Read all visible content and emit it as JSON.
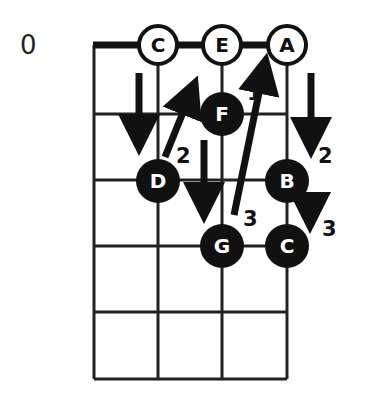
{
  "diagram": {
    "fret_label": "0",
    "strings": 4,
    "frets": 5,
    "open_notes": [
      {
        "label": "C",
        "string": 1
      },
      {
        "label": "E",
        "string": 2
      },
      {
        "label": "A",
        "string": 3
      }
    ],
    "fretted_notes": [
      {
        "label": "D",
        "string": 0,
        "fret": 2
      },
      {
        "label": "F",
        "string": 1,
        "fret": 1
      },
      {
        "label": "G",
        "string": 1,
        "fret": 3
      },
      {
        "label": "B",
        "string": 3,
        "fret": 2
      },
      {
        "label": "C",
        "string": 3,
        "fret": 3
      }
    ],
    "finger_numbers": [
      {
        "label": "1",
        "near": "F-to-A"
      },
      {
        "label": "2",
        "near": "D"
      },
      {
        "label": "2",
        "near": "A-to-B"
      },
      {
        "label": "3",
        "near": "G"
      },
      {
        "label": "3",
        "near": "B-to-C"
      }
    ],
    "colors": {
      "ink": "#111111",
      "background": "#ffffff"
    }
  }
}
